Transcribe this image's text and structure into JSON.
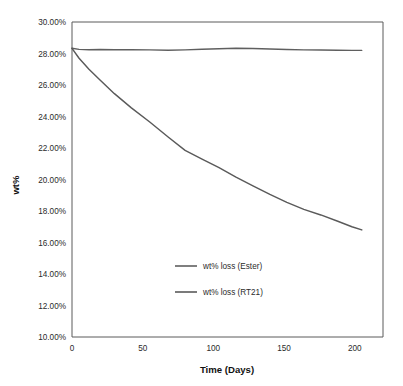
{
  "chart_data": {
    "type": "line",
    "title": "",
    "xlabel": "Time (Days)",
    "ylabel": "wt%",
    "xlim": [
      0,
      220
    ],
    "ylim": [
      0.1,
      0.3
    ],
    "grid": false,
    "legend_position": "center",
    "x_tick_labels": [
      "0",
      "50",
      "100",
      "150",
      "200"
    ],
    "x_ticks": [
      0,
      50,
      100,
      150,
      200
    ],
    "y_tick_labels": [
      "10.00%",
      "12.00%",
      "14.00%",
      "16.00%",
      "18.00%",
      "20.00%",
      "22.00%",
      "24.00%",
      "26.00%",
      "28.00%",
      "30.00%"
    ],
    "y_ticks": [
      0.1,
      0.12,
      0.14,
      0.16,
      0.18,
      0.2,
      0.22,
      0.24,
      0.26,
      0.28,
      0.3
    ],
    "series": [
      {
        "name": "wt% loss (Ester)",
        "color": "#5f5f5f",
        "x": [
          0,
          5,
          12,
          20,
          30,
          42,
          55,
          68,
          80,
          92,
          104,
          116,
          128,
          140,
          152,
          164,
          176,
          188,
          198,
          205
        ],
        "values": [
          0.2833,
          0.2826,
          0.2824,
          0.2825,
          0.2824,
          0.2824,
          0.2823,
          0.2821,
          0.2823,
          0.2827,
          0.283,
          0.2833,
          0.2832,
          0.2828,
          0.2825,
          0.2823,
          0.2822,
          0.2821,
          0.282,
          0.282
        ]
      },
      {
        "name": "wt% loss (RT21)",
        "color": "#5a5a5a",
        "x": [
          0,
          5,
          12,
          20,
          30,
          42,
          55,
          68,
          80,
          92,
          104,
          116,
          128,
          140,
          152,
          164,
          176,
          188,
          198,
          205
        ],
        "values": [
          0.2833,
          0.277,
          0.27,
          0.263,
          0.2545,
          0.2455,
          0.2365,
          0.227,
          0.2185,
          0.213,
          0.2075,
          0.2015,
          0.196,
          0.1905,
          0.1855,
          0.181,
          0.1775,
          0.1735,
          0.17,
          0.168
        ]
      }
    ],
    "legend_entries": [
      {
        "label": "wt% loss (Ester)",
        "color": "#5f5f5f"
      },
      {
        "label": "wt% loss (RT21)",
        "color": "#5a5a5a"
      }
    ]
  },
  "colors": {
    "axis": "#5a5a5a",
    "text": "#2b2b2b",
    "background": "#ffffff"
  }
}
